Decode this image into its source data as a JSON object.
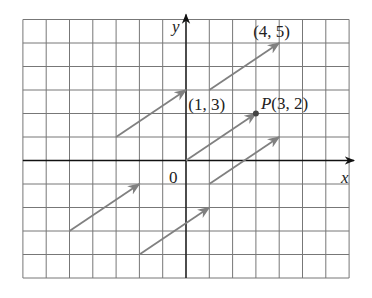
{
  "diagram": {
    "grid": {
      "x_min": -7,
      "x_max": 7,
      "y_min": -5,
      "y_max": 6
    },
    "axes": {
      "x_label": "x",
      "y_label": "y",
      "origin_label": "0"
    },
    "colors": {
      "grid": "#777777",
      "arrow": "#808080",
      "axis": "#111111",
      "point": "#444444"
    },
    "vectors": [
      {
        "from": [
          -3,
          1
        ],
        "to": [
          0,
          3
        ]
      },
      {
        "from": [
          1,
          3
        ],
        "to": [
          4,
          5
        ]
      },
      {
        "from": [
          0,
          0
        ],
        "to": [
          3,
          2
        ]
      },
      {
        "from": [
          -5,
          -3
        ],
        "to": [
          -2,
          -1
        ]
      },
      {
        "from": [
          -2,
          -4
        ],
        "to": [
          1,
          -2
        ]
      },
      {
        "from": [
          1,
          -1
        ],
        "to": [
          4,
          1
        ]
      }
    ],
    "labels": [
      {
        "text": "(4, 5)",
        "at": [
          4,
          5
        ]
      },
      {
        "text": "(1, 3)",
        "at": [
          1,
          3
        ]
      },
      {
        "text": "P(3, 2)",
        "at": [
          3,
          2
        ]
      }
    ],
    "point": {
      "name": "P",
      "coords": [
        3,
        2
      ]
    }
  }
}
